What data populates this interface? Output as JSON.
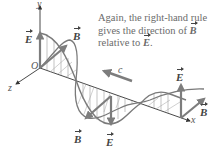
{
  "caption": {
    "line1": "Again, the right-hand rule",
    "line2_prefix": "gives the direction of ",
    "line2_vec": "B",
    "line3_prefix": "relative to ",
    "line3_vec": "E",
    "line3_suffix": "."
  },
  "labels": {
    "origin": "O",
    "x_axis": "x",
    "y_axis": "y",
    "z_axis": "z",
    "speed": "c",
    "E_top_left": "E",
    "B_top": "B",
    "E_right": "E",
    "B_right": "B",
    "B_bottom": "B",
    "E_bottom": "E"
  },
  "colors": {
    "wave": "#7a7a7a",
    "axis": "#333333",
    "arrow": "#7d7d7d",
    "text": "#6b6b6b"
  }
}
